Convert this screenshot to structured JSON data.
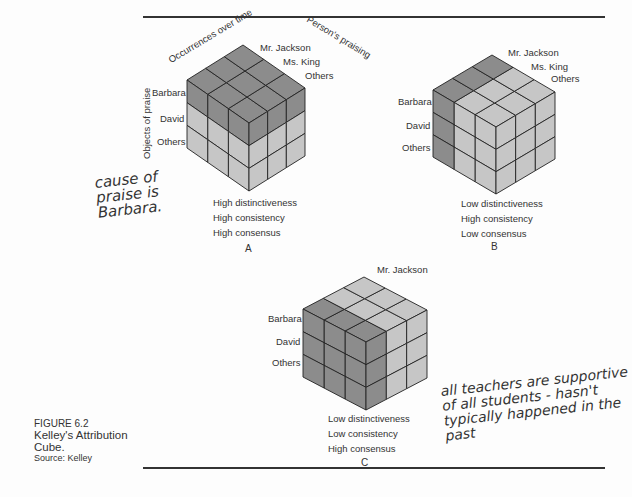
{
  "figure": {
    "number": "FIGURE 6.2",
    "title": "Kelley's Attribution Cube.",
    "source": "Source: Kelley"
  },
  "axes": {
    "occurrences": "Occurrences over time",
    "persons": "Person's praising",
    "objects": "Objects of praise"
  },
  "colors": {
    "dark": "#8c8c8c",
    "light": "#c6c6c6",
    "edge": "#222222"
  },
  "cubes": [
    {
      "id": "A",
      "letter": "A",
      "person_labels": [
        "Mr. Jackson",
        "Ms. King",
        "Others"
      ],
      "object_labels": [
        "Barbara",
        "David",
        "Others"
      ],
      "conditions": [
        "High distinctiveness",
        "High consistency",
        "High consensus"
      ],
      "dark_slab": "top-layer (Barbara)",
      "geom": {
        "top": [
          228,
          48
        ],
        "left": [
          187,
          80
        ],
        "front": [
          249,
          123
        ],
        "right": [
          305,
          88
        ],
        "h": 68
      }
    },
    {
      "id": "B",
      "letter": "B",
      "person_labels": [
        "Mr. Jackson",
        "Ms. King",
        "Others"
      ],
      "object_labels": [
        "Barbara",
        "David",
        "Others"
      ],
      "conditions": [
        "Low distinctiveness",
        "High consistency",
        "Low consensus"
      ],
      "dark_slab": "Mr. Jackson slab",
      "geom": {
        "top": [
          495,
          53
        ],
        "left": [
          433,
          90
        ],
        "front": [
          496,
          127
        ],
        "right": [
          555,
          92
        ],
        "h": 67
      }
    },
    {
      "id": "C",
      "letter": "C",
      "person_labels": [
        "Mr. Jackson"
      ],
      "object_labels": [
        "Barbara",
        "David",
        "Others"
      ],
      "conditions": [
        "Low distinctiveness",
        "Low consistency",
        "High consensus"
      ],
      "dark_slab": "first occurrence slab",
      "geom": {
        "top": [
          362,
          278
        ],
        "left": [
          303,
          309
        ],
        "front": [
          366,
          342
        ],
        "right": [
          427,
          310
        ],
        "h": 68
      }
    }
  ],
  "handwritten_notes": [
    {
      "lines": [
        "cause of",
        "praise is",
        "Barbara."
      ]
    },
    {
      "lines": [
        "all teachers are supportive",
        "of all students - hasn't",
        "typically happened in the",
        "past"
      ]
    }
  ]
}
